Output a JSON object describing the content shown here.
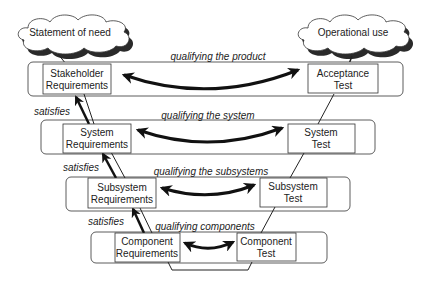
{
  "diagram": {
    "type": "V-model",
    "clouds": {
      "left": "Statement of need",
      "right": "Operational use"
    },
    "levels": [
      {
        "qualifying_label": "qualifying the product",
        "left_box": [
          "Stakeholder",
          "Requirements"
        ],
        "right_box": [
          "Acceptance",
          "Test"
        ]
      },
      {
        "qualifying_label": "qualifying the system",
        "left_box": [
          "System",
          "Requirements"
        ],
        "right_box": [
          "System",
          "Test"
        ],
        "satisfies_label": "satisfies"
      },
      {
        "qualifying_label": "qualifying the subsystems",
        "left_box": [
          "Subsystem",
          "Requirements"
        ],
        "right_box": [
          "Subsystem",
          "Test"
        ],
        "satisfies_label": "satisfies"
      },
      {
        "qualifying_label": "qualifying components",
        "left_box": [
          "Component",
          "Requirements"
        ],
        "right_box": [
          "Component",
          "Test"
        ],
        "satisfies_label": "satisfies"
      }
    ]
  },
  "colors": {
    "stroke": "#222222",
    "cloud_shadow": "#333333",
    "background": "#ffffff"
  }
}
